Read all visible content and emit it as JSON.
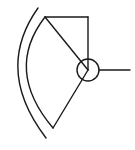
{
  "diagram": {
    "title": "",
    "symbol": "sector-antenna-symbol",
    "stroke_color": "#1a1a1a",
    "background": "#ffffff",
    "elements": [
      {
        "name": "outer-arc",
        "type": "arc"
      },
      {
        "name": "inner-arc",
        "type": "arc"
      },
      {
        "name": "top-edge-line",
        "type": "line"
      },
      {
        "name": "vertical-line",
        "type": "line"
      },
      {
        "name": "upper-radius-line",
        "type": "line"
      },
      {
        "name": "lower-radius-line",
        "type": "line"
      },
      {
        "name": "center-circle",
        "type": "circle"
      },
      {
        "name": "output-lead-line",
        "type": "line"
      }
    ]
  }
}
